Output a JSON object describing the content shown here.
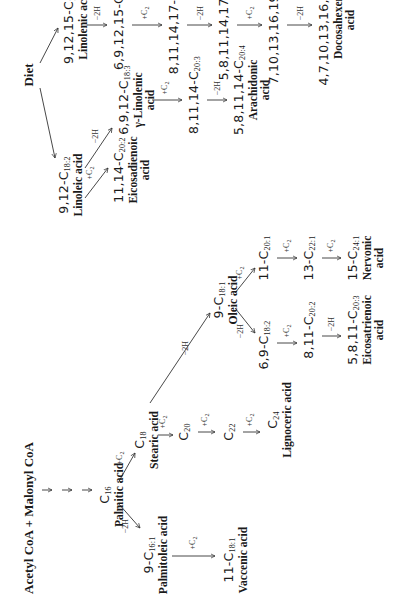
{
  "diagram": {
    "title": "Acetyl CoA + Malonyl CoA",
    "source": "Diet",
    "nodes": {
      "c16": {
        "prefix": "",
        "sub": "16",
        "name": "Palmitic acid"
      },
      "c16_1": {
        "prefix": "9-",
        "sub": "16:1",
        "name": "Palmitoleic acid"
      },
      "c18_1v": {
        "prefix": "11-",
        "sub": "18:1",
        "name": "Vaccenic acid"
      },
      "c18": {
        "prefix": "",
        "sub": "18",
        "name": "Stearic acid"
      },
      "c20": {
        "prefix": "",
        "sub": "20",
        "name": ""
      },
      "c22": {
        "prefix": "",
        "sub": "22",
        "name": ""
      },
      "c24": {
        "prefix": "",
        "sub": "24",
        "name": "Lignoceric acid"
      },
      "c18_1o": {
        "prefix": "9-",
        "sub": "18:1",
        "name": "Oleic acid"
      },
      "c20_1": {
        "prefix": "11-",
        "sub": "20:1",
        "name": ""
      },
      "c22_1": {
        "prefix": "13-",
        "sub": "22:1",
        "name": ""
      },
      "c24_1": {
        "prefix": "15-",
        "sub": "24:1",
        "name": "Nervonic",
        "name2": "acid"
      },
      "c18_2o": {
        "prefix": "6,9-",
        "sub": "18:2",
        "name": ""
      },
      "c20_2o": {
        "prefix": "8,11-",
        "sub": "20:2",
        "name": ""
      },
      "c20_3o": {
        "prefix": "5,8,11-",
        "sub": "20:3",
        "name": "Eicosatrienoic",
        "name2": "acid"
      },
      "c18_2l": {
        "prefix": "9,12-",
        "sub": "18:2",
        "name": "Linoleic acid"
      },
      "c20_2l": {
        "prefix": "11,14-",
        "sub": "20:2",
        "name": "Eicosadienoic",
        "name2": "acid"
      },
      "c18_3g": {
        "prefix": "6,9,12-",
        "sub": "18:3",
        "name": "γ-Linolenic",
        "name2": "acid"
      },
      "c20_3l": {
        "prefix": "8,11,14-",
        "sub": "20:3",
        "name": ""
      },
      "c20_4a": {
        "prefix": "5,8,11,14-",
        "sub": "20:4",
        "name": "Arachidonic",
        "name2": "acid"
      },
      "c18_3a": {
        "prefix": "9,12,15-",
        "sub": "18:3",
        "name": "Linolenic acid"
      },
      "c18_4": {
        "prefix": "6,9,12,15-",
        "sub": "18:4",
        "name": ""
      },
      "c20_4": {
        "prefix": "8,11,14,17-",
        "sub": "20:4",
        "name": ""
      },
      "c20_5": {
        "prefix": "5,8,11,14,17-",
        "sub": "20:5",
        "name": ""
      },
      "c22_5": {
        "prefix": "7,10,13,16,19-",
        "sub": "22:5",
        "name": ""
      },
      "c22_6": {
        "prefix": "4,7,10,13,16,19-",
        "sub": "22:6",
        "name": "Docosahexenoic",
        "name2": "acid"
      }
    },
    "element": "C",
    "step_labels": {
      "elongate": "+C",
      "elongate_sub": "2",
      "desaturate": "−2H"
    }
  }
}
